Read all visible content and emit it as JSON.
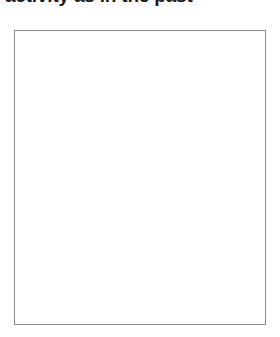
{
  "page": {
    "background_color": "#ffffff"
  },
  "heading": {
    "text": "activity as in the past",
    "color": "#1a1a1a",
    "clipped": "true"
  },
  "content_box": {
    "label": "",
    "border_color": "#8c8c8c",
    "fill_color": "#ffffff",
    "x": "14",
    "y": "30",
    "width": "252",
    "height": "295"
  }
}
